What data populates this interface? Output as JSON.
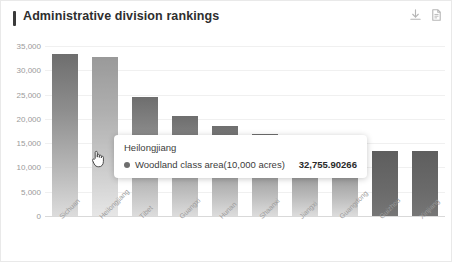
{
  "card": {
    "title": "Administrative division rankings",
    "actions": [
      {
        "name": "download-icon",
        "label": "Download"
      },
      {
        "name": "document-icon",
        "label": "Data view"
      }
    ]
  },
  "tooltip": {
    "title": "Heilongjiang",
    "series_label": "Woodland class area(10,000 acres)",
    "value": "32,755.90266",
    "marker_color": "#6e6e6e"
  },
  "colors": {
    "bar_top": "#6e6e6e",
    "bar_bottom": "#dcdcdc",
    "bar_flat": "#6a6a6a",
    "grid": "#f0f0f0",
    "axis": "#d9d9d9",
    "tick_text": "#9a9a9a",
    "title_text": "#2e2e2e"
  },
  "chart_data": {
    "type": "bar",
    "title": "Administrative division rankings",
    "xlabel": "",
    "ylabel": "",
    "ylim": [
      0,
      35000
    ],
    "yticks": [
      "0",
      "5,000",
      "10,000",
      "15,000",
      "20,000",
      "25,000",
      "30,000",
      "35,000"
    ],
    "ytick_values": [
      0,
      5000,
      10000,
      15000,
      20000,
      25000,
      30000,
      35000
    ],
    "grid": true,
    "legend": "none",
    "series_name": "Woodland class area(10,000 acres)",
    "categories": [
      "Sichuan",
      "Heilongjiang",
      "Tibet",
      "Guangxi",
      "Hunan",
      "Shaanxi",
      "Jiangxi",
      "Guangdong",
      "Guizhou",
      "Xinjiang"
    ],
    "values": [
      33350,
      32755.90266,
      24500,
      20600,
      18600,
      16900,
      15400,
      15200,
      13400,
      13400
    ],
    "highlighted_index": 1
  }
}
